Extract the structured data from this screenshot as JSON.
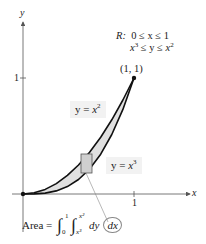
{
  "figure": {
    "axes": {
      "x_label": "x",
      "y_label": "y",
      "x_tick": "1",
      "y_tick": "1"
    },
    "region_definition": {
      "name": "R:",
      "line1": "0 ≤ x ≤ 1",
      "line2_lhs": "x",
      "line2_lhs_exp": "3",
      "line2_mid": " ≤ y ≤ ",
      "line2_rhs": "x",
      "line2_rhs_exp": "2"
    },
    "point_label": "(1, 1)",
    "curve_upper_label": {
      "prefix": "y = ",
      "base": "x",
      "exp": "2"
    },
    "curve_lower_label": {
      "prefix": "y = ",
      "base": "x",
      "exp": "3"
    },
    "area_formula": {
      "prefix": "Area = ",
      "outer_lower": "0",
      "outer_upper": "1",
      "inner_lower": "x³",
      "inner_upper": "x²",
      "inner_diff": "dy",
      "outer_diff": "dx"
    },
    "colors": {
      "curve": "#111111",
      "region_fill": "#e0e0e0",
      "axis": "#555555",
      "label_bg": "#f2f2f2"
    }
  }
}
